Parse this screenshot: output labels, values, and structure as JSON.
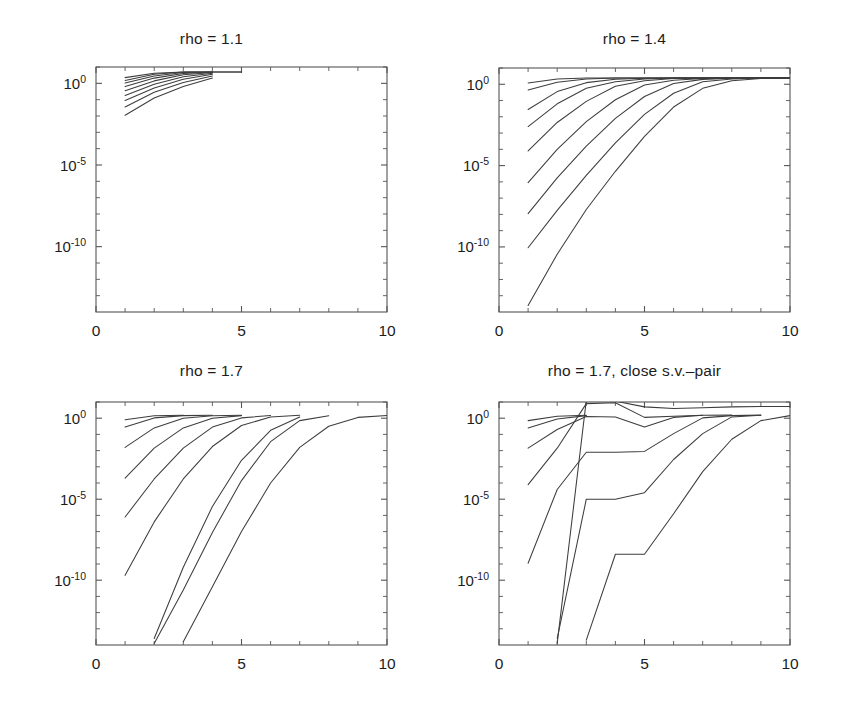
{
  "figure": {
    "background": "#ffffff",
    "line_color": "#3d3d3d",
    "axis_color": "#555555",
    "text_color": "#1c1c1c"
  },
  "axes": {
    "x": {
      "label": "",
      "min": 0,
      "max": 10,
      "ticks": [
        0,
        5,
        10
      ],
      "tick_labels": [
        "0",
        "5",
        "10"
      ],
      "minor_ticks": [
        1,
        2,
        3,
        4,
        6,
        7,
        8,
        9
      ]
    },
    "y": {
      "label": "",
      "scale": "log",
      "min_exponent": -14,
      "max_exponent": 1,
      "tick_exponents": [
        0,
        -5,
        -10
      ],
      "tick_labels": [
        "10",
        "10",
        "10"
      ],
      "tick_exponent_labels": [
        "0",
        "-5",
        "-10"
      ],
      "minor_tick_exponents": [
        1,
        -1,
        -2,
        -3,
        -4,
        -6,
        -7,
        -8,
        -9,
        -11,
        -12,
        -13
      ]
    }
  },
  "chart_data": [
    {
      "id": "panel-rho-1-1",
      "type": "line",
      "title": "rho = 1.1",
      "xlabel": "",
      "ylabel": "",
      "xlim": [
        0,
        10
      ],
      "ylim_exponent": [
        -14,
        1
      ],
      "yscale": "log",
      "grid": false,
      "legend": "none",
      "series": [
        {
          "name": "curve-1",
          "x": [
            1,
            2,
            3,
            4,
            5
          ],
          "y_exponent": [
            0.35,
            0.62,
            0.7,
            0.7,
            0.7
          ]
        },
        {
          "name": "curve-2",
          "x": [
            1,
            2,
            3,
            4,
            5
          ],
          "y_exponent": [
            0.18,
            0.55,
            0.69,
            0.7,
            0.7
          ]
        },
        {
          "name": "curve-3",
          "x": [
            1,
            2,
            3,
            4
          ],
          "y_exponent": [
            0.02,
            0.45,
            0.66,
            0.7
          ]
        },
        {
          "name": "curve-4",
          "x": [
            1,
            2,
            3,
            4
          ],
          "y_exponent": [
            -0.2,
            0.32,
            0.6,
            0.69
          ]
        },
        {
          "name": "curve-5",
          "x": [
            1,
            2,
            3,
            4
          ],
          "y_exponent": [
            -0.45,
            0.15,
            0.52,
            0.66
          ]
        },
        {
          "name": "curve-6",
          "x": [
            1,
            2,
            3,
            4
          ],
          "y_exponent": [
            -0.75,
            -0.05,
            0.4,
            0.62
          ]
        },
        {
          "name": "curve-7",
          "x": [
            1,
            2,
            3,
            4
          ],
          "y_exponent": [
            -1.05,
            -0.28,
            0.25,
            0.55
          ]
        },
        {
          "name": "curve-8",
          "x": [
            1,
            2,
            3,
            4
          ],
          "y_exponent": [
            -1.45,
            -0.55,
            0.05,
            0.45
          ]
        },
        {
          "name": "curve-9",
          "x": [
            1,
            2,
            3,
            4
          ],
          "y_exponent": [
            -1.95,
            -0.9,
            -0.2,
            0.32
          ]
        }
      ]
    },
    {
      "id": "panel-rho-1-4",
      "type": "line",
      "title": "rho = 1.4",
      "xlabel": "",
      "ylabel": "",
      "xlim": [
        0,
        10
      ],
      "ylim_exponent": [
        -14,
        1
      ],
      "yscale": "log",
      "grid": false,
      "legend": "none",
      "series": [
        {
          "name": "curve-1",
          "x": [
            1,
            2,
            3,
            4,
            5,
            6,
            7,
            8,
            9,
            10
          ],
          "y_exponent": [
            0.08,
            0.33,
            0.38,
            0.39,
            0.39,
            0.39,
            0.39,
            0.39,
            0.39,
            0.39
          ]
        },
        {
          "name": "curve-2",
          "x": [
            1,
            2,
            3,
            4,
            5,
            6,
            7,
            8,
            9,
            10
          ],
          "y_exponent": [
            -0.35,
            0.12,
            0.33,
            0.38,
            0.39,
            0.39,
            0.39,
            0.39,
            0.39,
            0.39
          ]
        },
        {
          "name": "curve-3",
          "x": [
            1,
            2,
            3,
            4,
            5,
            6,
            7,
            8,
            9,
            10
          ],
          "y_exponent": [
            -1.55,
            -0.45,
            0.1,
            0.31,
            0.37,
            0.39,
            0.39,
            0.39,
            0.39,
            0.39
          ]
        },
        {
          "name": "curve-4",
          "x": [
            1,
            2,
            3,
            4,
            5,
            6,
            7,
            8,
            9,
            10
          ],
          "y_exponent": [
            -2.6,
            -1.2,
            -0.25,
            0.15,
            0.33,
            0.38,
            0.39,
            0.39,
            0.39,
            0.39
          ]
        },
        {
          "name": "curve-5",
          "x": [
            1,
            2,
            3,
            4,
            5,
            6,
            7,
            8,
            9,
            10
          ],
          "y_exponent": [
            -4.1,
            -2.35,
            -1.05,
            -0.12,
            0.22,
            0.35,
            0.38,
            0.39,
            0.39,
            0.39
          ]
        },
        {
          "name": "curve-6",
          "x": [
            1,
            2,
            3,
            4,
            5,
            6,
            7,
            8,
            9,
            10
          ],
          "y_exponent": [
            -6.05,
            -4.0,
            -2.3,
            -0.95,
            -0.05,
            0.25,
            0.36,
            0.38,
            0.39,
            0.39
          ]
        },
        {
          "name": "curve-7",
          "x": [
            1,
            2,
            3,
            4,
            5,
            6,
            7,
            8,
            9,
            10
          ],
          "y_exponent": [
            -7.95,
            -5.75,
            -3.8,
            -2.1,
            -0.75,
            0.05,
            0.3,
            0.37,
            0.39,
            0.39
          ]
        },
        {
          "name": "curve-8",
          "x": [
            1,
            2,
            3,
            4,
            5,
            6,
            7,
            8,
            9,
            10
          ],
          "y_exponent": [
            -10.05,
            -7.75,
            -5.6,
            -3.6,
            -1.85,
            -0.55,
            0.15,
            0.33,
            0.38,
            0.39
          ]
        },
        {
          "name": "curve-9",
          "x": [
            1,
            2,
            3,
            4,
            5,
            6,
            7,
            8,
            9,
            10
          ],
          "y_exponent": [
            -13.6,
            -10.45,
            -7.7,
            -5.35,
            -3.2,
            -1.4,
            -0.25,
            0.22,
            0.36,
            0.39
          ]
        }
      ]
    },
    {
      "id": "panel-rho-1-7",
      "type": "line",
      "title": "rho = 1.7",
      "xlabel": "",
      "ylabel": "",
      "xlim": [
        0,
        10
      ],
      "ylim_exponent": [
        -14,
        1
      ],
      "yscale": "log",
      "grid": false,
      "legend": "none",
      "series": [
        {
          "name": "curve-1",
          "x": [
            1,
            2,
            3
          ],
          "y_exponent": [
            -0.1,
            0.15,
            0.18
          ]
        },
        {
          "name": "curve-2",
          "x": [
            1,
            2,
            3,
            4
          ],
          "y_exponent": [
            -0.55,
            0.02,
            0.16,
            0.18
          ]
        },
        {
          "name": "curve-3",
          "x": [
            1,
            2,
            3,
            4,
            5
          ],
          "y_exponent": [
            -1.8,
            -0.6,
            0.0,
            0.15,
            0.18
          ]
        },
        {
          "name": "curve-4",
          "x": [
            1,
            2,
            3,
            4,
            5
          ],
          "y_exponent": [
            -3.7,
            -1.85,
            -0.6,
            0.0,
            0.16
          ]
        },
        {
          "name": "curve-5",
          "x": [
            1,
            2,
            3,
            4,
            5,
            6
          ],
          "y_exponent": [
            -6.1,
            -3.75,
            -1.85,
            -0.55,
            0.02,
            0.17
          ]
        },
        {
          "name": "curve-6",
          "x": [
            1,
            2,
            3,
            4,
            5,
            6,
            7
          ],
          "y_exponent": [
            -9.7,
            -6.4,
            -3.75,
            -1.75,
            -0.45,
            0.07,
            0.18
          ]
        },
        {
          "name": "curve-7",
          "x": [
            2,
            3,
            4,
            5,
            6,
            7
          ],
          "y_exponent": [
            -13.6,
            -9.2,
            -5.45,
            -2.6,
            -0.75,
            0.08
          ]
        },
        {
          "name": "curve-8",
          "x": [
            2,
            3,
            4,
            5,
            6,
            7,
            8
          ],
          "y_exponent": [
            -13.9,
            -10.6,
            -7.05,
            -3.85,
            -1.45,
            -0.15,
            0.15
          ]
        },
        {
          "name": "curve-9",
          "x": [
            3,
            4,
            5,
            6,
            7,
            8,
            9,
            10
          ],
          "y_exponent": [
            -13.8,
            -10.4,
            -7.0,
            -4.0,
            -1.8,
            -0.5,
            0.05,
            0.17
          ]
        }
      ]
    },
    {
      "id": "panel-rho-1-7-close-sv",
      "type": "line",
      "title": "rho = 1.7,  close s.v.–pair",
      "xlabel": "",
      "ylabel": "",
      "xlim": [
        0,
        10
      ],
      "ylim_exponent": [
        -14,
        1
      ],
      "yscale": "log",
      "grid": false,
      "legend": "none",
      "series": [
        {
          "name": "curve-1",
          "x": [
            1,
            2,
            3
          ],
          "y_exponent": [
            -0.15,
            0.12,
            0.18
          ]
        },
        {
          "name": "curve-2",
          "x": [
            1,
            2,
            3
          ],
          "y_exponent": [
            -0.6,
            -0.05,
            0.16
          ]
        },
        {
          "name": "curve-3",
          "x": [
            1,
            2,
            3,
            4,
            5,
            6,
            7
          ],
          "y_exponent": [
            -1.85,
            -0.7,
            0.1,
            0.08,
            -0.55,
            0.05,
            0.18
          ]
        },
        {
          "name": "curve-4",
          "x": [
            1,
            2,
            3,
            4,
            5,
            6,
            7,
            8
          ],
          "y_exponent": [
            -4.1,
            -1.85,
            0.9,
            0.95,
            0.05,
            0.12,
            0.18,
            0.19
          ]
        },
        {
          "name": "curve-5",
          "x": [
            1,
            2,
            3,
            4,
            5,
            6,
            7,
            8,
            9
          ],
          "y_exponent": [
            -8.95,
            -4.4,
            -2.1,
            -2.1,
            -2.05,
            -0.95,
            0.02,
            0.16,
            0.19
          ]
        },
        {
          "name": "curve-6",
          "x": [
            2,
            3,
            4,
            5,
            6,
            7,
            8,
            9
          ],
          "y_exponent": [
            -13.6,
            -5.0,
            -5.0,
            -4.6,
            -2.55,
            -0.95,
            0.08,
            0.18
          ]
        },
        {
          "name": "curve-7",
          "x": [
            2,
            3,
            4,
            5,
            6,
            7,
            8,
            9,
            10
          ],
          "y_exponent": [
            -13.9,
            1.1,
            1.05,
            0.7,
            0.6,
            0.65,
            0.7,
            0.72,
            0.72
          ]
        },
        {
          "name": "curve-8",
          "x": [
            3,
            4,
            5,
            6,
            7,
            8,
            9,
            10
          ],
          "y_exponent": [
            -13.7,
            -8.4,
            -8.4,
            -5.9,
            -3.3,
            -1.3,
            -0.15,
            0.16
          ]
        }
      ]
    }
  ]
}
